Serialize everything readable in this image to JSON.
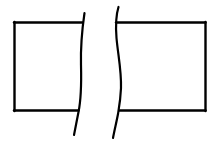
{
  "diagram": {
    "type": "conventional break (shortened view)",
    "stroke_color": "#000000",
    "background_color": "#ffffff",
    "parts": [
      {
        "name": "left-segment",
        "shape": "rectangle-section"
      },
      {
        "name": "right-segment",
        "shape": "rectangle-section"
      }
    ],
    "break_lines": [
      {
        "name": "left-break-line",
        "style": "wavy"
      },
      {
        "name": "right-break-line",
        "style": "wavy"
      }
    ]
  }
}
